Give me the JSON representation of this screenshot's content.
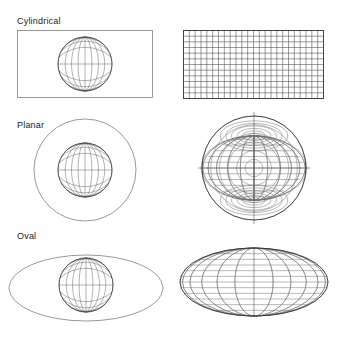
{
  "figure": {
    "background_color": "#ffffff",
    "line_color": "#4a4a4a",
    "surface_color": "#6d6d6d",
    "label_color": "#1a1a1a"
  },
  "rows": [
    {
      "label": "Cylindrical",
      "surface_shape": "rectangle",
      "surface_name": "cylinder-developed-rectangle",
      "projection_name": "cylindrical-graticule",
      "graticule": {
        "meridian_count": 24,
        "parallel_count": 12,
        "meridian_spacing_deg": 15,
        "parallel_spacing_deg": 15,
        "meridians_shape": "straight-vertical",
        "parallels_shape": "straight-horizontal",
        "outline": "rectangle"
      }
    },
    {
      "label": "Planar",
      "surface_shape": "circle",
      "surface_name": "plane-developed-circle",
      "projection_name": "planar-azimuthal-graticule",
      "graticule": {
        "meridian_count": 24,
        "parallel_count": 12,
        "meridian_spacing_deg": 15,
        "parallel_spacing_deg": 15,
        "meridians_shape": "curved-through-poles",
        "parallels_shape": "concentric-circles",
        "outline": "circle",
        "pole_points": 2
      }
    },
    {
      "label": "Oval",
      "surface_shape": "ellipse",
      "surface_name": "oval-developed-ellipse",
      "projection_name": "oval-pseudocylindrical-graticule",
      "graticule": {
        "meridian_count": 24,
        "parallel_count": 12,
        "meridian_spacing_deg": 15,
        "parallel_spacing_deg": 15,
        "meridians_shape": "elliptical-arcs",
        "parallels_shape": "straight-horizontal",
        "outline": "ellipse"
      }
    }
  ],
  "globe": {
    "name": "shaded-globe",
    "meridian_count": 12,
    "parallel_count": 7,
    "shading": "light-from-upper-left",
    "fill_light": "#e8e8e8",
    "fill_dark": "#8d8d8d"
  }
}
